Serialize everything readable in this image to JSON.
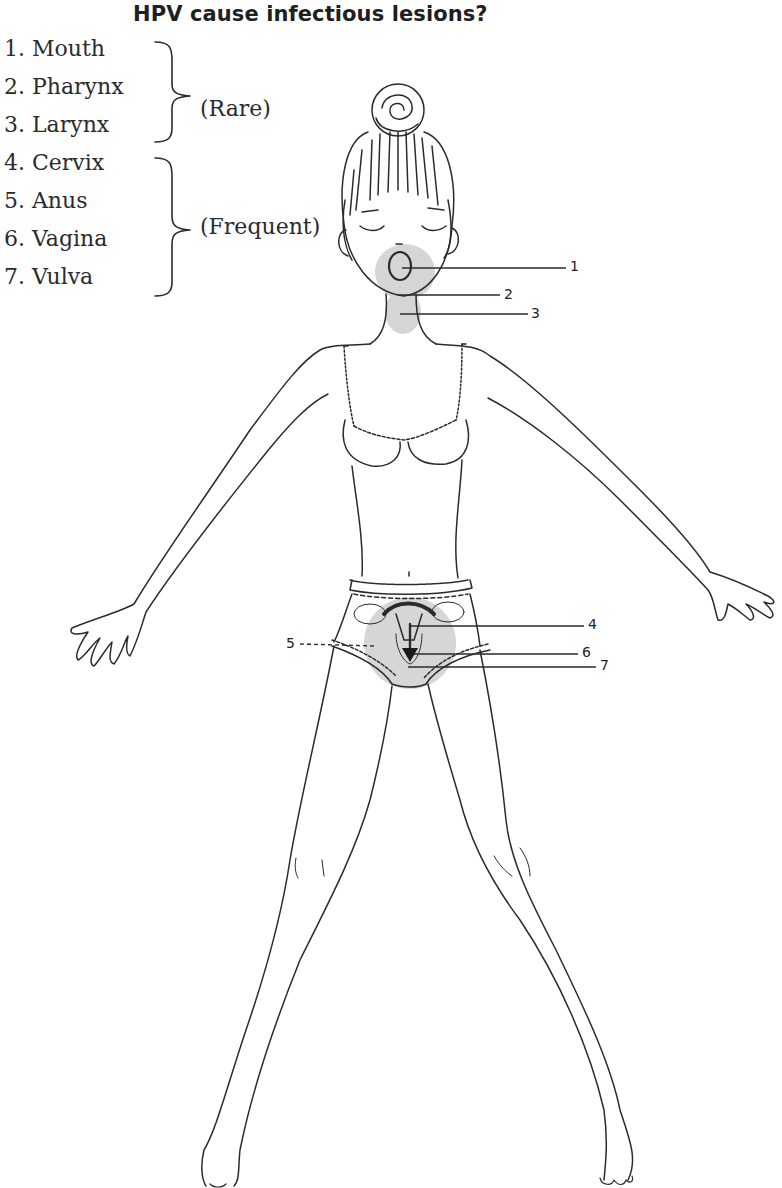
{
  "title": "HPV cause infectious lesions?",
  "legend": {
    "items": [
      {
        "number": "1.",
        "label": "Mouth",
        "text": "1.  Mouth"
      },
      {
        "number": "2.",
        "label": "Pharynx",
        "text": "2. Pharynx"
      },
      {
        "number": "3.",
        "label": "Larynx",
        "text": "3. Larynx"
      },
      {
        "number": "4.",
        "label": "Cervix",
        "text": "4. Cervix"
      },
      {
        "number": "5.",
        "label": "Anus",
        "text": "5.  Anus"
      },
      {
        "number": "6.",
        "label": "Vagina",
        "text": "6. Vagina"
      },
      {
        "number": "7.",
        "label": "Vulva",
        "text": "7. Vulva"
      }
    ],
    "groups": [
      {
        "label": "(Rare)",
        "members": [
          1,
          2,
          3
        ]
      },
      {
        "label": "(Frequent)",
        "members": [
          4,
          5,
          6,
          7
        ]
      }
    ]
  },
  "markers": {
    "m1": "1",
    "m2": "2",
    "m3": "3",
    "m4": "4",
    "m5": "5",
    "m6": "6",
    "m7": "7"
  },
  "colors": {
    "ink": "#2b2b2b",
    "highlight": "#c8c8c8",
    "background": "#ffffff"
  }
}
